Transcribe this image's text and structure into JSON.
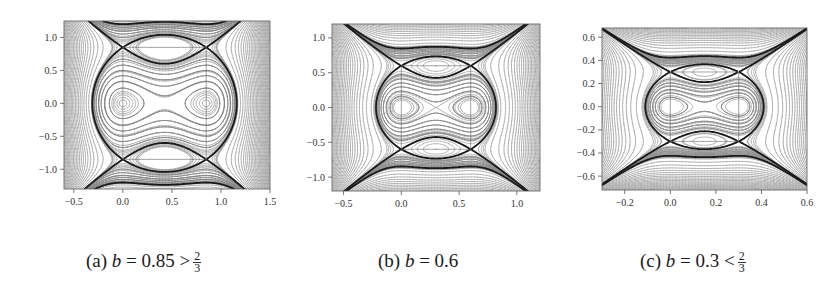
{
  "figure": {
    "panels": [
      {
        "id": "a",
        "caption": {
          "label": "(a)",
          "var": "b",
          "rel": "= 0.85 >",
          "frac_num": "2",
          "frac_den": "3"
        },
        "b": 0.85,
        "box": {
          "left": 64,
          "top": 21,
          "right": 270,
          "bottom": 189
        },
        "xlim": [
          -0.6,
          1.5
        ],
        "ylim": [
          -1.3,
          1.25
        ],
        "xticks": [
          -0.5,
          0.0,
          0.5,
          1.0,
          1.5
        ],
        "xtick_labels": [
          "−0.5",
          "0.0",
          "0.5",
          "1.0",
          "1.5"
        ],
        "yticks": [
          -1.0,
          -0.5,
          0.0,
          0.5,
          1.0
        ],
        "ytick_labels": [
          "−1.0",
          "−0.5",
          "0.0",
          "0.5",
          "1.0"
        ]
      },
      {
        "id": "b",
        "caption": {
          "label": "(b)",
          "var": "b",
          "rel": "= 0.6",
          "frac_num": "",
          "frac_den": ""
        },
        "b": 0.6,
        "box": {
          "left": 332,
          "top": 24,
          "right": 540,
          "bottom": 191
        },
        "xlim": [
          -0.6,
          1.2
        ],
        "ylim": [
          -1.2,
          1.2
        ],
        "xticks": [
          -0.5,
          0.0,
          0.5,
          1.0
        ],
        "xtick_labels": [
          "−0.5",
          "0.0",
          "0.5",
          "1.0"
        ],
        "yticks": [
          -1.0,
          -0.5,
          0.0,
          0.5,
          1.0
        ],
        "ytick_labels": [
          "−1.0",
          "−0.5",
          "0.0",
          "0.5",
          "1.0"
        ]
      },
      {
        "id": "c",
        "caption": {
          "label": "(c)",
          "var": "b",
          "rel": "= 0.3 <",
          "frac_num": "2",
          "frac_den": "3"
        },
        "b": 0.3,
        "box": {
          "left": 602,
          "top": 28,
          "right": 807,
          "bottom": 190
        },
        "xlim": [
          -0.3,
          0.6
        ],
        "ylim": [
          -0.72,
          0.68
        ],
        "xticks": [
          -0.2,
          0.0,
          0.2,
          0.4,
          0.6
        ],
        "xtick_labels": [
          "−0.2",
          "0.0",
          "0.2",
          "0.4",
          "0.6"
        ],
        "yticks": [
          -0.6,
          -0.4,
          -0.2,
          0.0,
          0.2,
          0.4,
          0.6
        ],
        "ytick_labels": [
          "−0.6",
          "−0.4",
          "−0.2",
          "0.0",
          "0.2",
          "0.4",
          "0.6"
        ]
      }
    ]
  },
  "chart_data": [
    {
      "type": "line",
      "title": "(a) b = 0.85 > 2/3",
      "description": "Phase portrait: level curves of a Hamiltonian with centers at (0,±0.85) and (0.85,0), saddles at (0,0) and (0.85,±0.85); separatrices drawn bold",
      "xlim": [
        -0.6,
        1.5
      ],
      "ylim": [
        -1.3,
        1.25
      ],
      "xticks": [
        -0.5,
        0.0,
        0.5,
        1.0,
        1.5
      ],
      "yticks": [
        -1.0,
        -0.5,
        0.0,
        0.5,
        1.0
      ],
      "centers": [
        [
          0,
          0.85
        ],
        [
          0,
          -0.85
        ],
        [
          0.85,
          0
        ]
      ],
      "saddles": [
        [
          0,
          0
        ],
        [
          0.85,
          0.85
        ],
        [
          0.85,
          -0.85
        ]
      ],
      "grid": false
    },
    {
      "type": "line",
      "title": "(b) b = 0.6",
      "description": "Phase portrait with centers at (0,±0.67) and (0.67,0), saddles at (0,0) and (0.67,±0.67)",
      "xlim": [
        -0.6,
        1.2
      ],
      "ylim": [
        -1.2,
        1.2
      ],
      "xticks": [
        -0.5,
        0.0,
        0.5,
        1.0
      ],
      "yticks": [
        -1.0,
        -0.5,
        0.0,
        0.5,
        1.0
      ],
      "centers": [
        [
          0,
          0.67
        ],
        [
          0,
          -0.67
        ],
        [
          0.67,
          0
        ]
      ],
      "saddles": [
        [
          0,
          0
        ],
        [
          0.67,
          0.67
        ],
        [
          0.67,
          -0.67
        ]
      ],
      "grid": false
    },
    {
      "type": "line",
      "title": "(c) b = 0.3 < 2/3",
      "description": "Phase portrait with centers at (0,±0.3) and (0.3,0), saddles at (0,0) and (0.3,±0.3); nested separatrix loops",
      "xlim": [
        -0.3,
        0.6
      ],
      "ylim": [
        -0.72,
        0.68
      ],
      "xticks": [
        -0.2,
        0.0,
        0.2,
        0.4,
        0.6
      ],
      "yticks": [
        -0.6,
        -0.4,
        -0.2,
        0.0,
        0.2,
        0.4,
        0.6
      ],
      "centers": [
        [
          0,
          0.3
        ],
        [
          0,
          -0.3
        ],
        [
          0.3,
          0
        ]
      ],
      "saddles": [
        [
          0,
          0
        ],
        [
          0.3,
          0.3
        ],
        [
          0.3,
          -0.3
        ]
      ],
      "grid": false
    }
  ]
}
